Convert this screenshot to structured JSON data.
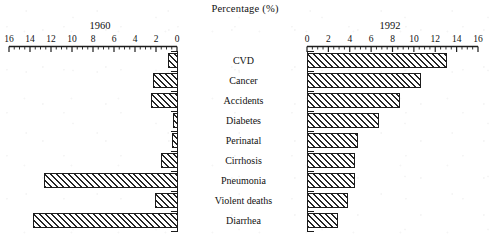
{
  "chart_data": {
    "type": "bar",
    "title": "Percentage (%)",
    "xlabel": "Percentage (%)",
    "ylabel": "",
    "orientation": "horizontal",
    "layout": "back-to-back bidirectional (butterfly / tornado) chart",
    "grid": false,
    "legend_position": "none",
    "categories": [
      "CVD",
      "Cancer",
      "Accidents",
      "Diabetes",
      "Perinatal",
      "Cirrhosis",
      "Pneumonia",
      "Violent deaths",
      "Diarrhea"
    ],
    "panels": [
      {
        "name": "1960",
        "side": "left",
        "axis_direction": "right-to-left",
        "xlim": [
          0,
          16
        ],
        "tick_labels": [
          "16",
          "14",
          "12",
          "10",
          "8",
          "6",
          "4",
          "2",
          "0"
        ],
        "tick_values": [
          16,
          14,
          12,
          10,
          8,
          6,
          4,
          2,
          0
        ],
        "minor_ticks": true,
        "values": [
          1.0,
          2.4,
          2.6,
          0.5,
          0.6,
          1.6,
          12.8,
          2.2,
          13.8
        ]
      },
      {
        "name": "1992",
        "side": "right",
        "axis_direction": "left-to-right",
        "xlim": [
          0,
          16
        ],
        "tick_labels": [
          "0",
          "2",
          "4",
          "6",
          "8",
          "10",
          "12",
          "14",
          "16"
        ],
        "tick_values": [
          0,
          2,
          4,
          6,
          8,
          10,
          12,
          14,
          16
        ],
        "minor_ticks": true,
        "values": [
          13.1,
          10.7,
          8.7,
          6.7,
          4.8,
          4.5,
          4.5,
          3.8,
          2.9
        ]
      }
    ],
    "series": [
      {
        "name": "1960",
        "values": [
          1.0,
          2.4,
          2.6,
          0.5,
          0.6,
          1.6,
          12.8,
          2.2,
          13.8
        ]
      },
      {
        "name": "1992",
        "values": [
          13.1,
          10.7,
          8.7,
          6.7,
          4.8,
          4.5,
          4.5,
          3.8,
          2.9
        ]
      }
    ],
    "style": {
      "bar_fill": "diagonal hatch pattern",
      "bar_edge_color": "#1c1c1c",
      "background": "#ffffff"
    }
  }
}
